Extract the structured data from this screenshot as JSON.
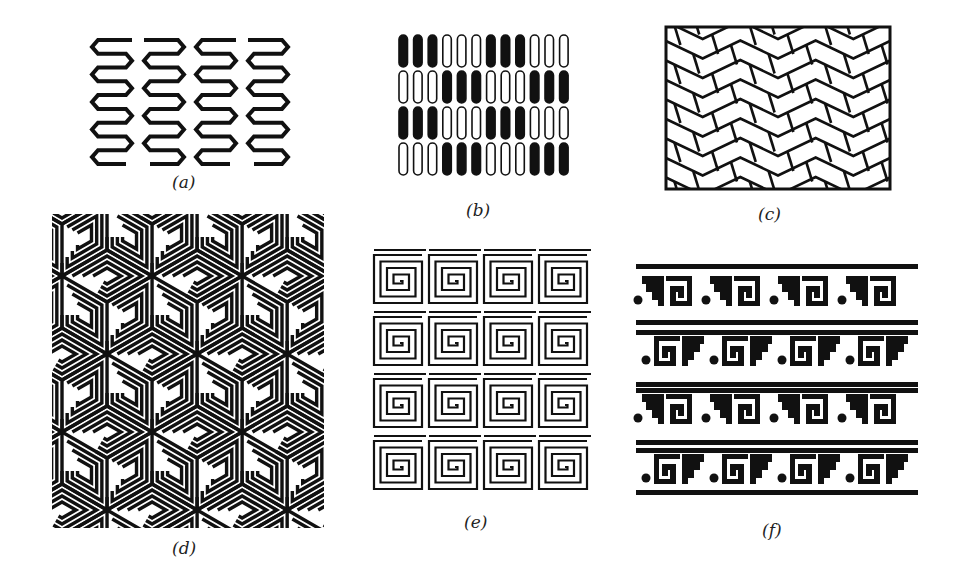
{
  "figure": {
    "ink_color": "#111111",
    "background_color": "#ffffff",
    "panels": [
      {
        "id": "a",
        "label": "(a)",
        "description": "four vertical zigzag serpentine strips",
        "columns": 4,
        "turns_per_strip": 9
      },
      {
        "id": "b",
        "label": "(b)",
        "description": "grid of rounded bars, groups of three alternating filled and outlined",
        "columns": 12,
        "rows": 4,
        "group_size": 3,
        "rows_pattern": [
          [
            1,
            1,
            1,
            0,
            0,
            0,
            1,
            1,
            1,
            0,
            0,
            0
          ],
          [
            0,
            0,
            0,
            1,
            1,
            1,
            0,
            0,
            0,
            1,
            1,
            1
          ],
          [
            1,
            1,
            1,
            0,
            0,
            0,
            1,
            1,
            1,
            0,
            0,
            0
          ],
          [
            0,
            0,
            0,
            1,
            1,
            1,
            0,
            0,
            0,
            1,
            1,
            1
          ]
        ]
      },
      {
        "id": "c",
        "label": "(c)",
        "description": "framed herringbone chevron brick tiling",
        "rows": 8,
        "chevron_columns": 3
      },
      {
        "id": "d",
        "label": "(d)",
        "description": "isometric cubes with square spiral (meander) faces"
      },
      {
        "id": "e",
        "label": "(e)",
        "description": "4x4 grid of square spirals",
        "rows": 4,
        "columns": 4
      },
      {
        "id": "f",
        "label": "(f)",
        "description": "stepped fret (xicalcoliuhqui) frieze bands with dots",
        "bands": 4,
        "motifs_per_band": 4
      }
    ]
  }
}
